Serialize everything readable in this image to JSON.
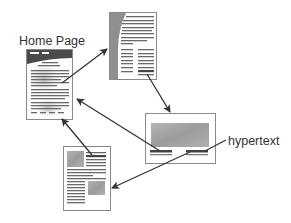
{
  "diagram": {
    "labels": {
      "home_page": "Home Page",
      "hypertext": "hypertext"
    },
    "nodes": [
      {
        "id": "home",
        "name": "Home Page document",
        "type": "page"
      },
      {
        "id": "page-a",
        "name": "Text page with side band",
        "type": "page"
      },
      {
        "id": "page-b",
        "name": "Page with image and hypertext links",
        "type": "page"
      },
      {
        "id": "page-c",
        "name": "Page with images and text",
        "type": "page"
      }
    ],
    "edges": [
      {
        "from": "home",
        "to": "page-a"
      },
      {
        "from": "page-a",
        "to": "page-b"
      },
      {
        "from": "page-b",
        "to": "home"
      },
      {
        "from": "page-c",
        "to": "home"
      },
      {
        "from": "page-b",
        "to": "page-c"
      }
    ],
    "colors": {
      "stroke": "#333333",
      "page_border": "#8a8a8a",
      "text_lines": "#6a6a6a",
      "image_fill": "#a8a8a8",
      "header_dark": "#4a4a4a",
      "band_fill": "#8f8f8f"
    }
  }
}
